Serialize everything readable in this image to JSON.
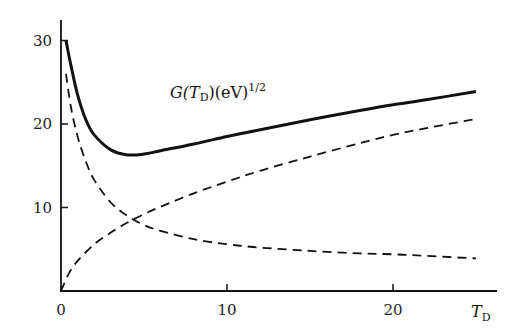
{
  "chart_data": {
    "type": "line",
    "title": "",
    "xlabel": "T_D",
    "ylabel": "",
    "xlim": [
      0,
      26
    ],
    "ylim": [
      0,
      32
    ],
    "x_ticks": [
      0,
      10,
      20
    ],
    "y_ticks": [
      10,
      20,
      30
    ],
    "x_tick_labels": [
      "0",
      "10",
      "20"
    ],
    "y_tick_labels": [
      "10",
      "20",
      "30"
    ],
    "grid": false,
    "legend": null,
    "annotations": [
      {
        "text": "G(T_D)(eV)^{1/2}",
        "x": 8.5,
        "y": 21,
        "refers_to": "G(T_D)"
      }
    ],
    "series": [
      {
        "name": "G(T_D)",
        "style": "solid",
        "x": [
          0.3,
          0.6,
          1,
          1.5,
          2,
          3,
          4,
          5,
          6,
          8,
          10,
          12,
          15,
          18,
          20,
          22,
          25
        ],
        "values": [
          30.0,
          27.0,
          23.5,
          20.5,
          18.7,
          16.9,
          16.3,
          16.4,
          16.8,
          17.6,
          18.5,
          19.3,
          20.5,
          21.6,
          22.3,
          22.9,
          23.9
        ]
      },
      {
        "name": "decreasing term",
        "style": "dashed",
        "x": [
          0.3,
          0.6,
          1,
          1.5,
          2,
          3,
          4,
          5,
          6,
          8,
          10,
          12,
          15,
          18,
          20,
          22,
          25
        ],
        "values": [
          26.0,
          22.0,
          18.5,
          15.5,
          13.3,
          10.6,
          9.0,
          7.9,
          7.2,
          6.2,
          5.6,
          5.2,
          4.8,
          4.5,
          4.4,
          4.2,
          3.9
        ]
      },
      {
        "name": "increasing term",
        "style": "dashed",
        "x": [
          0,
          0.5,
          1,
          2,
          3,
          4,
          5,
          6,
          8,
          10,
          12,
          15,
          18,
          20,
          22,
          25
        ],
        "values": [
          0,
          2.2,
          3.6,
          5.6,
          7.0,
          8.2,
          9.2,
          10.1,
          11.7,
          13.1,
          14.4,
          16.1,
          17.7,
          18.7,
          19.5,
          20.6
        ]
      }
    ]
  }
}
